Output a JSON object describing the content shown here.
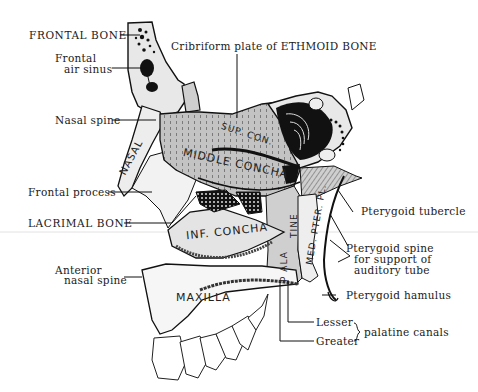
{
  "figure": {
    "colors": {
      "background": "#ffffff",
      "ink": "#111111",
      "bone_light": "#e9e9e9",
      "bone_mid": "#c9c9c9",
      "bone_dark": "#a9a9a9"
    }
  },
  "labels": {
    "frontal_bone": "FRONTAL BONE",
    "frontal_air_sinus_1": "Frontal",
    "frontal_air_sinus_2": "air sinus",
    "cribriform": "Cribriform plate of ETHMOID BONE",
    "nasal_spine": "Nasal spine",
    "frontal_process": "Frontal process",
    "lacrimal_bone": "LACRIMAL BONE",
    "anterior_nasal_spine_1": "Anterior",
    "anterior_nasal_spine_2": "nasal spine",
    "pterygoid_tubercle": "Pterygoid tubercle",
    "pterygoid_spine_1": "Pterygoid spine",
    "pterygoid_spine_2": "for support of",
    "pterygoid_spine_3": "auditory tube",
    "pterygoid_hamulus": "Pterygoid hamulus",
    "lesser": "Lesser",
    "greater": "Greater",
    "palatine_canals": "palatine canals"
  },
  "bone_text": {
    "nasal": "NASAL",
    "sup_con": "SUP. CON.",
    "middle_concha": "MIDDLE CONCHA",
    "inf_concha": "INF. CONCHA",
    "maxilla": "MAXILLA",
    "palatine_upper": "TINE",
    "palatine_lower": "P ALA",
    "med_pter": "MED. PTER. PL."
  }
}
